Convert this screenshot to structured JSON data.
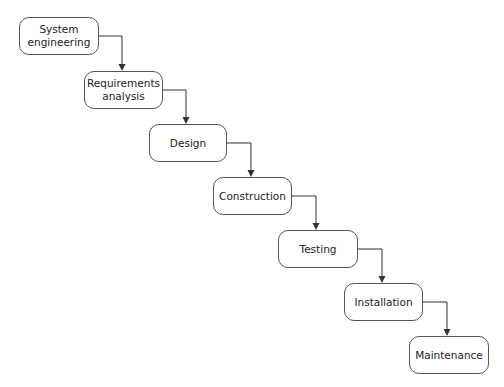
{
  "diagram": {
    "type": "waterfall",
    "stages": [
      {
        "label": "System\nengineering",
        "x": 19,
        "y": 17,
        "w": 80,
        "h": 38
      },
      {
        "label": "Requirements\nanalysis",
        "x": 84,
        "y": 71,
        "w": 79,
        "h": 38
      },
      {
        "label": "Design",
        "x": 149,
        "y": 124,
        "w": 78,
        "h": 38
      },
      {
        "label": "Construction",
        "x": 213,
        "y": 177,
        "w": 79,
        "h": 38
      },
      {
        "label": "Testing",
        "x": 278,
        "y": 230,
        "w": 80,
        "h": 38
      },
      {
        "label": "Installation",
        "x": 344,
        "y": 283,
        "w": 79,
        "h": 38
      },
      {
        "label": "Maintenance",
        "x": 409,
        "y": 336,
        "w": 80,
        "h": 38
      }
    ],
    "connections": [
      {
        "from": 0,
        "to": 1
      },
      {
        "from": 1,
        "to": 2
      },
      {
        "from": 2,
        "to": 3
      },
      {
        "from": 3,
        "to": 4
      },
      {
        "from": 4,
        "to": 5
      },
      {
        "from": 5,
        "to": 6
      }
    ],
    "colors": {
      "line": "#333333",
      "border": "#555555",
      "text": "#222222",
      "background": "#ffffff"
    }
  }
}
